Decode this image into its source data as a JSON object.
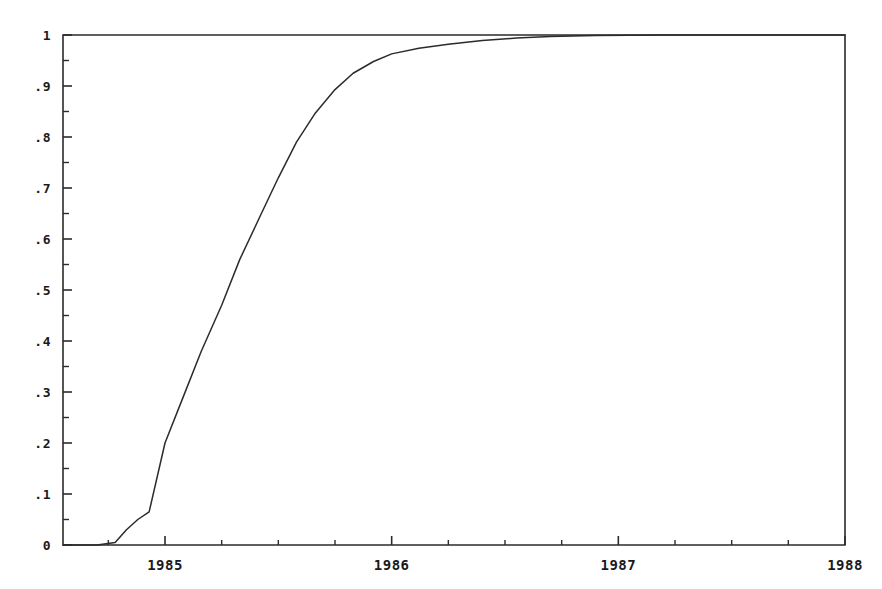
{
  "chart_data": {
    "type": "line",
    "title": "",
    "subtitle": "",
    "xlabel": "",
    "ylabel": "",
    "xlim": [
      1984.55,
      1988.0
    ],
    "ylim": [
      0,
      1
    ],
    "grid": false,
    "legend": null,
    "x_tick_labels": [
      "1985",
      "1986",
      "1987",
      "1988"
    ],
    "x_tick_values": [
      1985,
      1986,
      1987,
      1988
    ],
    "x_minor_tick_values": [
      1984.75,
      1985.25,
      1985.5,
      1985.75,
      1986.25,
      1986.5,
      1986.75,
      1987.25,
      1987.5,
      1987.75
    ],
    "y_tick_labels": [
      "0",
      ".1",
      ".2",
      ".3",
      ".4",
      ".5",
      ".6",
      ".7",
      ".8",
      ".9",
      "1"
    ],
    "y_tick_values": [
      0,
      0.1,
      0.2,
      0.3,
      0.4,
      0.5,
      0.6,
      0.7,
      0.8,
      0.9,
      1
    ],
    "y_minor_tick_values": [
      0.05,
      0.15,
      0.25,
      0.35,
      0.45,
      0.55,
      0.65,
      0.75,
      0.85,
      0.95
    ],
    "series": [
      {
        "name": "cumulative-fraction",
        "color": "#2b2b2b",
        "x": [
          1984.55,
          1984.7,
          1984.78,
          1984.83,
          1984.88,
          1984.93,
          1985.0,
          1985.08,
          1985.16,
          1985.25,
          1985.33,
          1985.42,
          1985.5,
          1985.58,
          1985.66,
          1985.75,
          1985.83,
          1985.92,
          1986.0,
          1986.12,
          1986.25,
          1986.4,
          1986.55,
          1986.7,
          1986.9,
          1987.2,
          1987.6,
          1988.0
        ],
        "y": [
          0.0,
          0.0,
          0.005,
          0.03,
          0.05,
          0.065,
          0.2,
          0.29,
          0.38,
          0.47,
          0.56,
          0.645,
          0.72,
          0.79,
          0.845,
          0.893,
          0.925,
          0.948,
          0.963,
          0.974,
          0.982,
          0.989,
          0.994,
          0.997,
          0.999,
          1.0,
          1.0,
          1.0
        ]
      }
    ],
    "axes": {
      "left_spine": true,
      "bottom_spine": true,
      "top_spine": true,
      "right_spine": true,
      "tick_direction": "in-out",
      "line_color": "#2b2b2b"
    }
  },
  "geometry": {
    "plot_left": 63,
    "plot_right": 845,
    "plot_top": 35,
    "plot_bottom": 545
  }
}
